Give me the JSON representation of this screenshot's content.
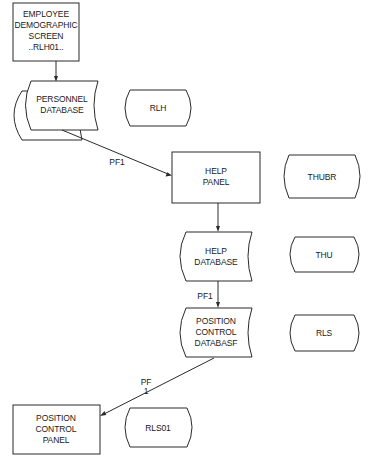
{
  "diagram": {
    "type": "flowchart",
    "nodes": [
      {
        "id": "employee_screen",
        "shape": "rectangle",
        "lines": [
          "EMPLOYEE",
          "DEMOGRAPHIC",
          "SCREEN",
          "..RLH01.."
        ]
      },
      {
        "id": "personnel_db",
        "shape": "multi-document",
        "lines": [
          "PERSONNEL",
          "DATABASE"
        ]
      },
      {
        "id": "rlh",
        "shape": "terminator",
        "lines": [
          "RLH"
        ]
      },
      {
        "id": "help_panel",
        "shape": "rectangle",
        "lines": [
          "HELP",
          "PANEL"
        ]
      },
      {
        "id": "thubr",
        "shape": "terminator",
        "lines": [
          "THUBR"
        ]
      },
      {
        "id": "help_db",
        "shape": "stored-data",
        "lines": [
          "HELP",
          "DATABASE"
        ]
      },
      {
        "id": "thu",
        "shape": "terminator",
        "lines": [
          "THU"
        ]
      },
      {
        "id": "position_db",
        "shape": "stored-data",
        "lines": [
          "POSITION",
          "CONTROL",
          "DATABASF"
        ]
      },
      {
        "id": "rls",
        "shape": "terminator",
        "lines": [
          "RLS"
        ]
      },
      {
        "id": "position_panel",
        "shape": "rectangle",
        "lines": [
          "POSITION",
          "CONTROL",
          "PANEL"
        ]
      },
      {
        "id": "rls01",
        "shape": "terminator",
        "lines": [
          "RLS01"
        ]
      }
    ],
    "edges": [
      {
        "from": "employee_screen",
        "to": "personnel_db",
        "label": ""
      },
      {
        "from": "personnel_db",
        "to": "help_panel",
        "label": "PF1"
      },
      {
        "from": "help_panel",
        "to": "help_db",
        "label": ""
      },
      {
        "from": "help_db",
        "to": "position_db",
        "label": "PF1"
      },
      {
        "from": "position_db",
        "to": "position_panel",
        "label_lines": [
          "PF",
          "1"
        ]
      }
    ]
  }
}
